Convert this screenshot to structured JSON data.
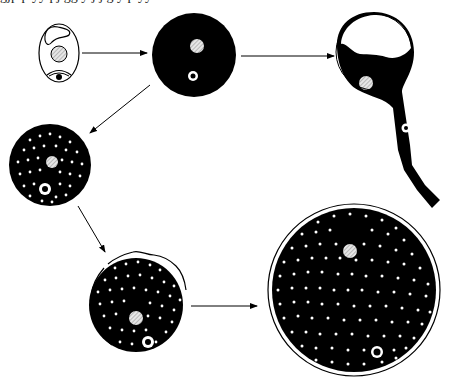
{
  "figure": {
    "caption_fragment": "gjp  p  yy pj  gg  y j  j  g  y  p  yy",
    "colors": {
      "ink": "#000000",
      "paper": "#ffffff",
      "nucleus_hatch": "#cfcfcf"
    },
    "stages": [
      {
        "id": "initial-cell",
        "description": "Oval cell with vacuole, hatched nucleus and eye-like organelle"
      },
      {
        "id": "dark-rounded-cell",
        "description": "Black spherical cell with nucleus and ring organelle"
      },
      {
        "id": "germinating-cell",
        "description": "Cell forming tubular outgrowth with nucleus and organelle migrating"
      },
      {
        "id": "granular-cell",
        "description": "Black cell filled with white granules"
      },
      {
        "id": "encapsulating-cell",
        "description": "Granular cell with wavy outer wall forming"
      },
      {
        "id": "mature-cyst",
        "description": "Large double-walled cyst densely filled with granules"
      }
    ],
    "arrows": [
      {
        "from": "initial-cell",
        "to": "dark-rounded-cell"
      },
      {
        "from": "dark-rounded-cell",
        "to": "germinating-cell"
      },
      {
        "from": "dark-rounded-cell",
        "to": "granular-cell"
      },
      {
        "from": "granular-cell",
        "to": "encapsulating-cell"
      },
      {
        "from": "encapsulating-cell",
        "to": "mature-cyst"
      }
    ]
  }
}
